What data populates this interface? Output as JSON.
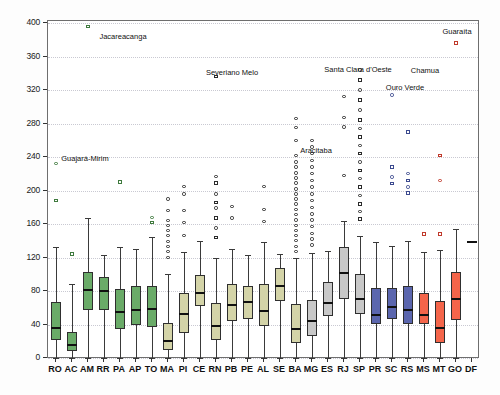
{
  "axes": {
    "ylabel": "Taxa de mortalidade geral só Covid confirmada por 100.000",
    "xlabel": "",
    "yticks": [
      0,
      40,
      80,
      120,
      160,
      200,
      240,
      280,
      320,
      360,
      400
    ],
    "ylim": [
      0,
      405
    ],
    "grid": true
  },
  "chart_data": {
    "type": "box",
    "title": "",
    "xlabel": "",
    "ylabel": "Taxa de mortalidade geral só Covid confirmada por 100.000",
    "ylim": [
      0,
      405
    ],
    "yticks": [
      0,
      40,
      80,
      120,
      160,
      200,
      240,
      280,
      320,
      360,
      400
    ],
    "grid": true,
    "legend": "none",
    "categories": [
      "RO",
      "AC",
      "AM",
      "RR",
      "PA",
      "AP",
      "TO",
      "MA",
      "PI",
      "CE",
      "RN",
      "PB",
      "PE",
      "AL",
      "SE",
      "BA",
      "MG",
      "ES",
      "RJ",
      "SP",
      "PR",
      "SC",
      "RS",
      "MS",
      "MT",
      "GO",
      "DF"
    ],
    "region_colors": {
      "north": "#6aab68",
      "northeast": "#d4d4a8",
      "southeast": "#c8c8c8",
      "south": "#5b66ae",
      "centerwest": "#f4654a"
    },
    "boxes": [
      {
        "label": "RO",
        "region": "north",
        "color": "#6aab68",
        "whisker_low": 0,
        "q1": 22,
        "median": 37,
        "q3": 67,
        "whisker_high": 133,
        "outliers": [
          188,
          232
        ]
      },
      {
        "label": "AC",
        "region": "north",
        "color": "#6aab68",
        "whisker_low": 0,
        "q1": 8,
        "median": 17,
        "q3": 31,
        "whisker_high": 88,
        "outliers": [
          124
        ]
      },
      {
        "label": "AM",
        "region": "north",
        "color": "#6aab68",
        "whisker_low": 0,
        "q1": 57,
        "median": 82,
        "q3": 103,
        "whisker_high": 167,
        "outliers": [
          396
        ]
      },
      {
        "label": "RR",
        "region": "north",
        "color": "#6aab68",
        "whisker_low": 0,
        "q1": 57,
        "median": 81,
        "q3": 97,
        "whisker_high": 123,
        "outliers": []
      },
      {
        "label": "PA",
        "region": "north",
        "color": "#6aab68",
        "whisker_low": 0,
        "q1": 35,
        "median": 56,
        "q3": 82,
        "whisker_high": 133,
        "outliers": [
          210
        ]
      },
      {
        "label": "AP",
        "region": "north",
        "color": "#6aab68",
        "whisker_low": 0,
        "q1": 39,
        "median": 58,
        "q3": 86,
        "whisker_high": 130,
        "outliers": []
      },
      {
        "label": "TO",
        "region": "north",
        "color": "#6aab68",
        "whisker_low": 0,
        "q1": 37,
        "median": 60,
        "q3": 86,
        "whisker_high": 145,
        "outliers": [
          162,
          168
        ]
      },
      {
        "label": "MA",
        "region": "northeast",
        "color": "#d4d4a8",
        "whisker_low": 0,
        "q1": 10,
        "median": 22,
        "q3": 42,
        "whisker_high": 100,
        "outliers": [
          120,
          127,
          133,
          139,
          146,
          152,
          158,
          164,
          176,
          190
        ]
      },
      {
        "label": "PI",
        "region": "northeast",
        "color": "#d4d4a8",
        "whisker_low": 0,
        "q1": 30,
        "median": 54,
        "q3": 78,
        "whisker_high": 127,
        "outliers": [
          146,
          162,
          176,
          196,
          205
        ]
      },
      {
        "label": "CE",
        "region": "northeast",
        "color": "#d4d4a8",
        "whisker_low": 0,
        "q1": 62,
        "median": 79,
        "q3": 99,
        "whisker_high": 140,
        "outliers": []
      },
      {
        "label": "RN",
        "region": "northeast",
        "color": "#d4d4a8",
        "whisker_low": 0,
        "q1": 21,
        "median": 39,
        "q3": 66,
        "whisker_high": 120,
        "outliers": [
          144,
          155,
          167,
          179,
          186,
          196,
          209,
          217,
          336
        ]
      },
      {
        "label": "PB",
        "region": "northeast",
        "color": "#d4d4a8",
        "whisker_low": 0,
        "q1": 44,
        "median": 64,
        "q3": 88,
        "whisker_high": 130,
        "outliers": [
          167,
          181
        ]
      },
      {
        "label": "PE",
        "region": "northeast",
        "color": "#d4d4a8",
        "whisker_low": 0,
        "q1": 46,
        "median": 68,
        "q3": 86,
        "whisker_high": 123,
        "outliers": []
      },
      {
        "label": "AL",
        "region": "northeast",
        "color": "#d4d4a8",
        "whisker_low": 0,
        "q1": 38,
        "median": 57,
        "q3": 88,
        "whisker_high": 138,
        "outliers": [
          163,
          177,
          205
        ]
      },
      {
        "label": "SE",
        "region": "northeast",
        "color": "#d4d4a8",
        "whisker_low": 0,
        "q1": 68,
        "median": 87,
        "q3": 108,
        "whisker_high": 124,
        "outliers": []
      },
      {
        "label": "BA",
        "region": "northeast",
        "color": "#d4d4a8",
        "whisker_low": 0,
        "q1": 18,
        "median": 36,
        "q3": 64,
        "whisker_high": 120,
        "outliers": [
          127,
          133,
          140,
          146,
          152,
          158,
          165,
          171,
          177,
          184,
          190,
          196,
          202,
          209,
          215,
          221,
          228,
          234,
          242,
          260,
          275,
          286
        ]
      },
      {
        "label": "MG",
        "region": "southeast",
        "color": "#c8c8c8",
        "whisker_low": 0,
        "q1": 26,
        "median": 45,
        "q3": 69,
        "whisker_high": 125,
        "outliers": [
          135,
          142,
          149,
          157,
          165,
          172,
          180,
          188,
          196,
          204,
          212,
          220,
          228,
          236,
          244,
          252,
          260
        ]
      },
      {
        "label": "ES",
        "region": "southeast",
        "color": "#c8c8c8",
        "whisker_low": 0,
        "q1": 50,
        "median": 67,
        "q3": 91,
        "whisker_high": 128,
        "outliers": []
      },
      {
        "label": "RJ",
        "region": "southeast",
        "color": "#c8c8c8",
        "whisker_low": 0,
        "q1": 70,
        "median": 103,
        "q3": 133,
        "whisker_high": 164,
        "outliers": [
          218,
          276,
          287,
          312
        ]
      },
      {
        "label": "SP",
        "region": "southeast",
        "color": "#c8c8c8",
        "whisker_low": 0,
        "q1": 53,
        "median": 72,
        "q3": 100,
        "whisker_high": 146,
        "outliers": [
          166,
          175,
          184,
          194,
          204,
          214,
          224,
          234,
          244,
          254,
          264,
          274,
          284,
          296,
          308,
          320,
          332,
          344
        ]
      },
      {
        "label": "PR",
        "region": "south",
        "color": "#5b66ae",
        "whisker_low": 0,
        "q1": 40,
        "median": 52,
        "q3": 84,
        "whisker_high": 139,
        "outliers": []
      },
      {
        "label": "SC",
        "region": "south",
        "color": "#5b66ae",
        "whisker_low": 0,
        "q1": 47,
        "median": 62,
        "q3": 84,
        "whisker_high": 134,
        "outliers": [
          208,
          216,
          228,
          314
        ]
      },
      {
        "label": "RS",
        "region": "south",
        "color": "#5b66ae",
        "whisker_low": 0,
        "q1": 40,
        "median": 58,
        "q3": 86,
        "whisker_high": 140,
        "outliers": [
          197,
          204,
          212,
          220,
          270
        ]
      },
      {
        "label": "MS",
        "region": "centerwest",
        "color": "#f4654a",
        "whisker_low": 0,
        "q1": 41,
        "median": 53,
        "q3": 78,
        "whisker_high": 127,
        "outliers": [
          148
        ]
      },
      {
        "label": "MT",
        "region": "centerwest",
        "color": "#f4654a",
        "whisker_low": 0,
        "q1": 18,
        "median": 37,
        "q3": 68,
        "whisker_high": 129,
        "outliers": [
          148,
          212,
          242
        ]
      },
      {
        "label": "GO",
        "region": "centerwest",
        "color": "#f4654a",
        "whisker_low": 0,
        "q1": 45,
        "median": 72,
        "q3": 103,
        "whisker_high": 154,
        "outliers": [
          376
        ]
      },
      {
        "label": "DF",
        "region": "centerwest",
        "color": "#f4654a",
        "whisker_low": 140,
        "q1": 140,
        "median": 140,
        "q3": 140,
        "whisker_high": 140,
        "outliers": []
      }
    ],
    "annotations": [
      {
        "text": "Guajará-Mirim",
        "category": "RO",
        "value": 232,
        "label_x": 85,
        "label_y": 154
      },
      {
        "text": "Jacareacanga",
        "category": "AM",
        "value": 396,
        "label_x": 123,
        "label_y": 32
      },
      {
        "text": "Severiano Melo",
        "category": "RN",
        "value": 336,
        "label_x": 232,
        "label_y": 68
      },
      {
        "text": "Aracitaba",
        "category": "MG",
        "value": 260,
        "label_x": 316,
        "label_y": 146
      },
      {
        "text": "Santa Clara d'Oeste",
        "category": "SP",
        "value": 320,
        "label_x": 358,
        "label_y": 65
      },
      {
        "text": "Ouro Verde",
        "category": "SP",
        "value": 287,
        "label_x": 405,
        "label_y": 83
      },
      {
        "text": "Chamua",
        "category": "SC",
        "value": 314,
        "label_x": 425,
        "label_y": 66
      },
      {
        "text": "Guaraíta",
        "category": "GO",
        "value": 376,
        "label_x": 457,
        "label_y": 27
      }
    ]
  }
}
